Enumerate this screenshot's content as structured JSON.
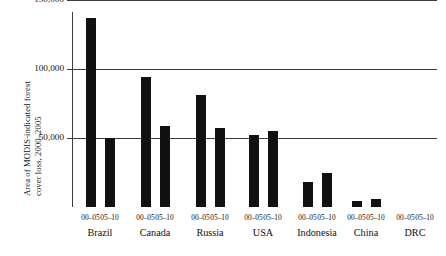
{
  "chart_data": {
    "type": "bar",
    "title": "",
    "xlabel": "",
    "ylabel_line1": "Area of MODIS-indicated forest",
    "ylabel_line2": "cover loss, 2000–2005",
    "ylim": [
      0,
      160000
    ],
    "ytick_labels": [
      "150,000",
      "100,000",
      "50,000"
    ],
    "ytick_values": [
      150000,
      100000,
      50000
    ],
    "grid": true,
    "legend": "none",
    "bar_color": "#111111",
    "axis_color": "#3c3c3c",
    "categories": [
      "Brazil",
      "Canada",
      "Russia",
      "USA",
      "Indonesia",
      "China",
      "DRC"
    ],
    "period_labels": [
      "00–05",
      "05–10"
    ],
    "series": [
      {
        "name": "00–05",
        "values": [
          137000,
          94000,
          81000,
          52000,
          18000,
          4500,
          0
        ]
      },
      {
        "name": "05–10",
        "values": [
          50000,
          59000,
          57000,
          55000,
          25000,
          5500,
          0
        ]
      }
    ],
    "bars": [
      {
        "country": "Brazil",
        "period": "00–05",
        "value": 137000
      },
      {
        "country": "Brazil",
        "period": "05–10",
        "value": 50000
      },
      {
        "country": "Canada",
        "period": "00–05",
        "value": 94000
      },
      {
        "country": "Canada",
        "period": "05–10",
        "value": 59000
      },
      {
        "country": "Russia",
        "period": "00–05",
        "value": 81000
      },
      {
        "country": "Russia",
        "period": "05–10",
        "value": 57000
      },
      {
        "country": "USA",
        "period": "00–05",
        "value": 52000
      },
      {
        "country": "USA",
        "period": "05–10",
        "value": 55000
      },
      {
        "country": "Indonesia",
        "period": "00–05",
        "value": 18000
      },
      {
        "country": "Indonesia",
        "period": "05–10",
        "value": 25000
      },
      {
        "country": "China",
        "period": "00–05",
        "value": 4500
      },
      {
        "country": "China",
        "period": "05–10",
        "value": 5500
      },
      {
        "country": "DRC",
        "period": "00–05",
        "value": 0
      },
      {
        "country": "DRC",
        "period": "05–10",
        "value": 0
      }
    ]
  }
}
